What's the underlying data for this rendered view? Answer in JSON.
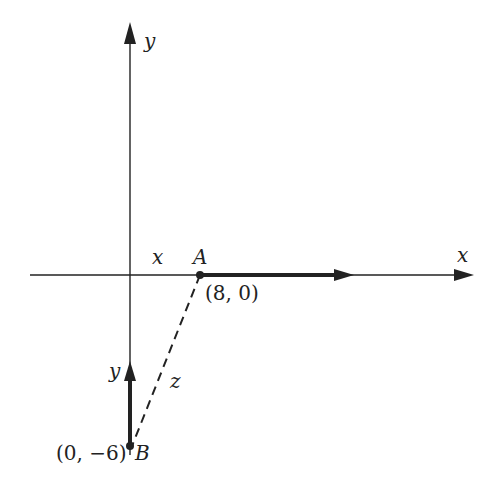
{
  "diagram": {
    "axes": {
      "x_label": "x",
      "y_label": "y"
    },
    "points": {
      "A": {
        "label": "A",
        "coords": "(8, 0)"
      },
      "B": {
        "label": "B",
        "coords": "(0, −6)"
      }
    },
    "segments": {
      "x_label": "x",
      "y_label": "y",
      "z_label": "z"
    },
    "colors": {
      "ink": "#222222",
      "background": "#ffffff"
    }
  }
}
